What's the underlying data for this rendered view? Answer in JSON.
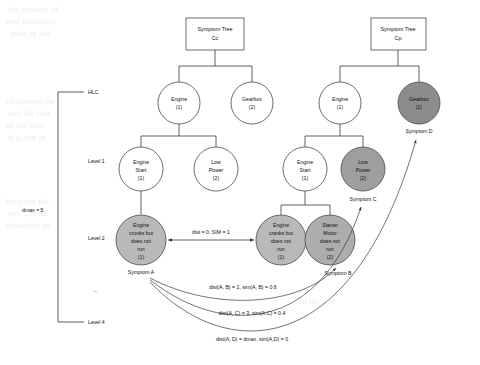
{
  "diagram": {
    "title_boxes": [
      {
        "id": "tree-cc",
        "line1": "Symptom Tree",
        "line2": "Cc"
      },
      {
        "id": "tree-cp",
        "line1": "Symptom Tree",
        "line2": "Cp"
      }
    ],
    "axis": {
      "dmax_label": "dmax = 5",
      "levels": [
        {
          "key": "hlc",
          "label": "HLC"
        },
        {
          "key": "lvl1",
          "label": "Level 1"
        },
        {
          "key": "lvl2",
          "label": "Level 2"
        },
        {
          "key": "dots",
          "label": "..."
        },
        {
          "key": "lvl4",
          "label": "Level 4"
        }
      ]
    },
    "nodes": {
      "cc_engine": {
        "l1": "Engine",
        "l2": "(1)",
        "fill": "#ffffff"
      },
      "cc_gearbox": {
        "l1": "Gearbox",
        "l2": "(2)",
        "fill": "#ffffff"
      },
      "cc_engine_start": {
        "l1": "Engine",
        "l2": "Start",
        "l3": "(1)",
        "fill": "#ffffff"
      },
      "cc_low_power": {
        "l1": "Low",
        "l2": "Power",
        "l3": "(2)",
        "fill": "#ffffff"
      },
      "cc_crank": {
        "l1": "Engine",
        "l2": "crunks but",
        "l3": "does not",
        "l4": "run",
        "l5": "(1)",
        "fill": "#b9b9b9"
      },
      "cp_engine": {
        "l1": "Engine",
        "l2": "(1)",
        "fill": "#ffffff"
      },
      "cp_gearbox": {
        "l1": "Gearbox",
        "l2": "(2)",
        "fill": "#8c8c8c"
      },
      "cp_engine_start": {
        "l1": "Engine",
        "l2": "Start",
        "l3": "(1)",
        "fill": "#ffffff"
      },
      "cp_low_power": {
        "l1": "Low",
        "l2": "Power",
        "l3": "(2)",
        "fill": "#9e9e9e"
      },
      "cp_crank": {
        "l1": "Engine",
        "l2": "cranks but",
        "l3": "does not",
        "l4": "run",
        "l5": "(1)",
        "fill": "#b9b9b9"
      },
      "cp_starter": {
        "l1": "Starter",
        "l2": "Motor",
        "l3": "does not",
        "l4": "run",
        "l5": "(2)",
        "fill": "#adadad"
      }
    },
    "symptom_labels": [
      {
        "key": "a",
        "text": "Symptom A"
      },
      {
        "key": "b",
        "text": "Symptom B"
      },
      {
        "key": "c",
        "text": "Symptom C"
      },
      {
        "key": "d",
        "text": "Symptom D"
      }
    ],
    "edge_labels": [
      {
        "key": "ab_direct",
        "text": "dist = 0, SIM = 1"
      }
    ],
    "curve_labels": [
      {
        "key": "ab",
        "text": "dist(A, B) = 2, sim(A, B) = 0.6"
      },
      {
        "key": "ac",
        "text": "dist(A, C) = 3, sim(A,C) = 0.4"
      },
      {
        "key": "ad",
        "text": "dist(A, D) = dmax, sim(A,D) = 0"
      }
    ],
    "colors": {
      "stroke": "#4a4a4a",
      "light": "#ffffff",
      "shade_light": "#b9b9b9",
      "shade_mid": "#adadad",
      "shade_dark": "#9e9e9e",
      "shade_darkest": "#8c8c8c"
    }
  }
}
